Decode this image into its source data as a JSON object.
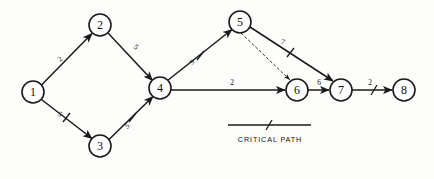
{
  "diagram": {
    "legend": {
      "label": "CRITICAL PATH",
      "marker": "hatch-mark"
    },
    "nodes": [
      {
        "id": "1",
        "label": "1",
        "cx": 33,
        "cy": 92,
        "r": 11
      },
      {
        "id": "2",
        "label": "2",
        "cx": 100,
        "cy": 25,
        "r": 11
      },
      {
        "id": "3",
        "label": "3",
        "cx": 100,
        "cy": 146,
        "r": 11
      },
      {
        "id": "4",
        "label": "4",
        "cx": 160,
        "cy": 88,
        "r": 11
      },
      {
        "id": "5",
        "label": "5",
        "cx": 240,
        "cy": 22,
        "r": 11
      },
      {
        "id": "6",
        "label": "6",
        "cx": 297,
        "cy": 90,
        "r": 11
      },
      {
        "id": "7",
        "label": "7",
        "cx": 341,
        "cy": 90,
        "r": 11
      },
      {
        "id": "8",
        "label": "8",
        "cx": 404,
        "cy": 90,
        "r": 11
      }
    ],
    "edges": [
      {
        "id": "e1",
        "from": "1",
        "to": "2",
        "label": "2",
        "lx": 60,
        "ly": 59,
        "critical": false,
        "dummy": false
      },
      {
        "id": "e2",
        "from": "2",
        "to": "4",
        "label": "5",
        "lx": 136,
        "ly": 47,
        "critical": false,
        "dummy": false
      },
      {
        "id": "e3",
        "from": "1",
        "to": "3",
        "label": "5",
        "lx": 60,
        "ly": 114,
        "critical": true,
        "dummy": false
      },
      {
        "id": "e4",
        "from": "3",
        "to": "4",
        "label": "5",
        "lx": 127,
        "ly": 126,
        "critical": true,
        "dummy": false
      },
      {
        "id": "e5",
        "from": "4",
        "to": "5",
        "label": "9",
        "lx": 192,
        "ly": 62,
        "critical": true,
        "dummy": false
      },
      {
        "id": "e6",
        "from": "4",
        "to": "6",
        "label": "2",
        "lx": 232,
        "ly": 82,
        "critical": false,
        "dummy": false
      },
      {
        "id": "e7",
        "from": "5",
        "to": "6",
        "label": "",
        "lx": 0,
        "ly": 0,
        "critical": false,
        "dummy": true
      },
      {
        "id": "e8",
        "from": "5",
        "to": "7",
        "label": "7",
        "lx": 283,
        "ly": 42,
        "critical": true,
        "dummy": false
      },
      {
        "id": "e9",
        "from": "6",
        "to": "7",
        "label": "6",
        "lx": 319,
        "ly": 82,
        "critical": false,
        "dummy": false
      },
      {
        "id": "e10",
        "from": "7",
        "to": "8",
        "label": "2",
        "lx": 370,
        "ly": 82,
        "critical": true,
        "dummy": false
      }
    ]
  }
}
